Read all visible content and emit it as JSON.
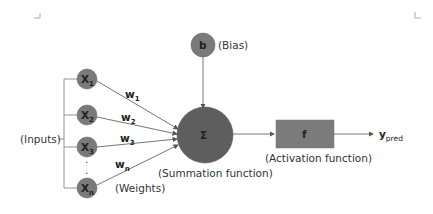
{
  "diagram": {
    "type": "perceptron",
    "colors": {
      "node_fill": "#7a7a7a",
      "sum_fill": "#5e5e5e",
      "box_fill": "#7b7b7b",
      "line": "#666666",
      "text": "#333333"
    },
    "inputs": {
      "label": "(Inputs)",
      "nodes": [
        {
          "base": "X",
          "sub": "1"
        },
        {
          "base": "X",
          "sub": "2"
        },
        {
          "base": "X",
          "sub": "3"
        },
        {
          "base": "X",
          "sub": "n"
        }
      ],
      "ellipsis": "."
    },
    "weights": {
      "label": "(Weights)",
      "items": [
        {
          "base": "w",
          "sub": "1"
        },
        {
          "base": "w",
          "sub": "2"
        },
        {
          "base": "w",
          "sub": "3"
        },
        {
          "base": "w",
          "sub": "n"
        }
      ]
    },
    "bias": {
      "symbol": "b",
      "label": "(Bias)"
    },
    "summation": {
      "symbol": "Σ",
      "label": "(Summation function)"
    },
    "activation": {
      "symbol": "f",
      "label": "(Activation function)"
    },
    "output": {
      "base": "y",
      "sub": "pred"
    }
  }
}
